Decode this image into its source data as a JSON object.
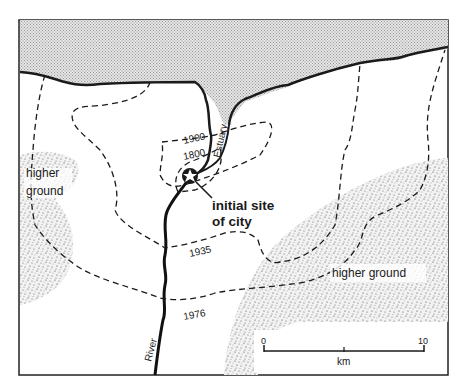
{
  "map": {
    "water_label": "Estuary",
    "river_label": "River",
    "site_label_line1": "initial site",
    "site_label_line2": "of city",
    "higher_ground_left_line1": "higher",
    "higher_ground_left_line2": "ground",
    "higher_ground_right": "higher ground",
    "growth_boundaries": [
      {
        "year": "1800"
      },
      {
        "year": "1900"
      },
      {
        "year": "1935"
      },
      {
        "year": "1976"
      }
    ],
    "scale": {
      "start": "0",
      "end": "10",
      "unit": "km"
    },
    "colors": {
      "ink": "#1a1a1a",
      "water": "#d9d9d9",
      "land": "#ffffff",
      "stipple": "#555555"
    }
  }
}
